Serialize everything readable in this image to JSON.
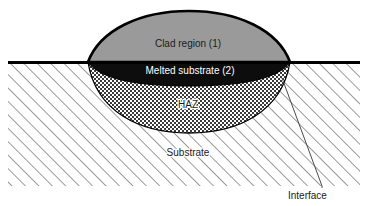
{
  "figure": {
    "type": "cross-section-schematic",
    "background_color": "#ffffff"
  },
  "regions": {
    "clad": {
      "label": "Clad region (1)",
      "fill_color": "#9a9a9a",
      "outline_color": "#000000",
      "label_x": 188,
      "label_y": 47
    },
    "melted_substrate": {
      "label": "Melted substrate (2)",
      "fill_color": "#0d0d0d",
      "text_color": "#ffffff",
      "label_x": 190,
      "label_y": 70
    },
    "haz": {
      "label": "HAZ",
      "fill_color": "#b4b4b4",
      "pattern": "checkerboard",
      "label_x": 188,
      "label_y": 107
    },
    "substrate": {
      "label": "Substrate",
      "fill_color": "#ffffff",
      "pattern": "diagonal-hatch",
      "hatch_color": "#555555",
      "label_x": 188,
      "label_y": 155
    }
  },
  "annotations": {
    "interface": {
      "label": "Interface",
      "label_x": 288,
      "label_y": 198,
      "leader_from_x": 282,
      "leader_from_y": 78,
      "leader_to_x": 322,
      "leader_to_y": 186,
      "line_color": "#444444"
    }
  },
  "surface_line": {
    "name": "substrate-top-surface",
    "color": "#000000",
    "x_start": 8,
    "x_end": 360,
    "y": 62,
    "thickness": 3
  },
  "bounds": {
    "left": 8,
    "right": 360,
    "top": 62,
    "bottom": 186
  }
}
